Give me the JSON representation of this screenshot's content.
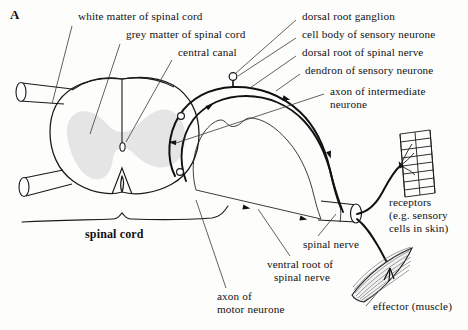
{
  "figure": {
    "panel_letter": "A",
    "title_semantic": "spinal-cord-reflex-arc-cross-section",
    "colors": {
      "grey_matter": "#e5e5e5",
      "white_matter": "#ffffff",
      "outline": "#1a1a1a",
      "neuron_path": "#111111",
      "background": "#fdfdfc",
      "leader_line": "#3a3a3a"
    }
  },
  "labels": {
    "white_matter": "white matter of spinal cord",
    "grey_matter": "grey matter of spinal cord",
    "central_canal": "central canal",
    "dorsal_root_ganglion": "dorsal root ganglion",
    "cell_body_sensory": "cell body of sensory neurone",
    "dorsal_root": "dorsal root of spinal nerve",
    "dendron_sensory": "dendron of sensory neurone",
    "axon_intermediate_line1": "axon of intermediate",
    "axon_intermediate_line2": "neurone",
    "receptors_line1": "receptors",
    "receptors_line2": "(e.g. sensory",
    "receptors_line3": "cells in skin)",
    "effector": "effector (muscle)",
    "spinal_nerve": "spinal nerve",
    "ventral_root_line1": "ventral root of",
    "ventral_root_line2": "spinal nerve",
    "axon_motor_line1": "axon of",
    "axon_motor_line2": "motor neurone",
    "spinal_cord_brace": "spinal cord"
  },
  "structures": [
    {
      "name": "spinal-cord-outline",
      "kind": "oval-cross-section"
    },
    {
      "name": "grey-matter-butterfly",
      "kind": "filled-region"
    },
    {
      "name": "central-canal",
      "kind": "small-oval"
    },
    {
      "name": "dorsal-root-ganglion",
      "kind": "circle-node"
    },
    {
      "name": "sensory-neurone-dendron",
      "kind": "curved-path"
    },
    {
      "name": "intermediate-neurone-axon",
      "kind": "curved-path"
    },
    {
      "name": "motor-neurone-axon",
      "kind": "curved-path"
    },
    {
      "name": "spinal-nerve-trunk",
      "kind": "cylinder"
    },
    {
      "name": "receptor-skin-patch",
      "kind": "ladder-grid"
    },
    {
      "name": "effector-muscle",
      "kind": "spindle-striated"
    },
    {
      "name": "left-nerve-stub-upper",
      "kind": "cylinder"
    },
    {
      "name": "left-nerve-stub-lower",
      "kind": "cylinder"
    },
    {
      "name": "spinal-cord-brace",
      "kind": "curly-brace"
    }
  ]
}
